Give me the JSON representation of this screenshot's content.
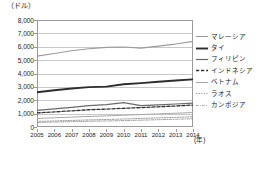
{
  "chart_data": {
    "type": "line",
    "title": "",
    "subtitle": "",
    "xlabel": "(年)",
    "ylabel": "（ドル）",
    "unit_label": "（ドル）",
    "x_unit_label": "(年)",
    "grid": true,
    "legend_position": "right",
    "xlim": [
      2005,
      2014
    ],
    "ylim": [
      0,
      8000
    ],
    "ytick_step": 1000,
    "categories": [
      "2005",
      "2006",
      "2007",
      "2008",
      "2009",
      "2010",
      "2011",
      "2012",
      "2013",
      "2014"
    ],
    "x": [
      2005,
      2006,
      2007,
      2008,
      2009,
      2010,
      2011,
      2012,
      2013,
      2014
    ],
    "ytick_labels": [
      "8,000",
      "7,000",
      "6,000",
      "5,000",
      "4,000",
      "3,000",
      "2,000",
      "1,000",
      "0"
    ],
    "ytick_values": [
      8000,
      7000,
      6000,
      5000,
      4000,
      3000,
      2000,
      1000,
      0
    ],
    "series": [
      {
        "name": "マレーシア",
        "style": "solid-thin-gray",
        "color": "#9b9b9b",
        "width": 1.1,
        "dash": "",
        "values": [
          5300,
          5500,
          5700,
          5850,
          5950,
          5980,
          5900,
          6050,
          6200,
          6400
        ]
      },
      {
        "name": "タイ",
        "style": "solid-thick-dark",
        "color": "#2d2d2d",
        "width": 1.9,
        "dash": "",
        "values": [
          2600,
          2750,
          2880,
          2980,
          3020,
          3200,
          3280,
          3380,
          3480,
          3560
        ]
      },
      {
        "name": "フィリピン",
        "style": "solid-medium-gray",
        "color": "#6a6a6a",
        "width": 1.2,
        "dash": "",
        "values": [
          1250,
          1350,
          1470,
          1600,
          1680,
          1820,
          1600,
          1660,
          1720,
          1790
        ]
      },
      {
        "name": "インドネシア",
        "style": "dashed-dark",
        "color": "#333333",
        "width": 1.3,
        "dash": "3.2,1.8",
        "values": [
          1050,
          1130,
          1210,
          1290,
          1340,
          1400,
          1450,
          1510,
          1570,
          1640
        ]
      },
      {
        "name": "ベトナム",
        "style": "solid-thin-lightgray",
        "color": "#a8a8a8",
        "width": 1.0,
        "dash": "",
        "values": [
          640,
          690,
          740,
          790,
          830,
          880,
          930,
          980,
          1030,
          1080
        ]
      },
      {
        "name": "ラオス",
        "style": "dotted-gray",
        "color": "#8d8d8d",
        "width": 0.9,
        "dash": "1.2,1.4",
        "values": [
          420,
          450,
          490,
          530,
          560,
          600,
          640,
          680,
          720,
          770
        ]
      },
      {
        "name": "カンボジア",
        "style": "dash-dot-gray",
        "color": "#9a9a9a",
        "width": 0.9,
        "dash": "2.6,1.3,0.8,1.3",
        "values": [
          340,
          370,
          400,
          430,
          450,
          480,
          510,
          545,
          580,
          620
        ]
      }
    ]
  },
  "axes": {
    "unit_label": "（ドル）",
    "x_unit_label": "(年)"
  }
}
